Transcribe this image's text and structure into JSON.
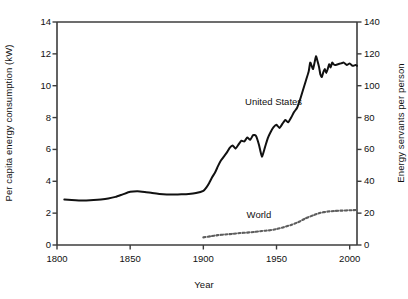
{
  "chart_data": {
    "type": "line",
    "title": "",
    "xlabel": "Year",
    "ylabel": "Per capita energy consumption (kW)",
    "y2label": "Energy servants per person",
    "xlim": [
      1800,
      2005
    ],
    "ylim": [
      0,
      14
    ],
    "y2lim": [
      0,
      140
    ],
    "grid": false,
    "legend": "inline-annotations",
    "xticks": [
      1800,
      1850,
      1900,
      1950,
      2000
    ],
    "xtick_labels": [
      "1800",
      "1850",
      "1900",
      "1950",
      "2000"
    ],
    "yticks": [
      0,
      2,
      4,
      6,
      8,
      10,
      12,
      14
    ],
    "ytick_labels": [
      "0",
      "2",
      "4",
      "6",
      "8",
      "10",
      "12",
      "14"
    ],
    "y2ticks": [
      0,
      20,
      40,
      60,
      80,
      100,
      120,
      140
    ],
    "y2tick_labels": [
      "0",
      "20",
      "40",
      "60",
      "80",
      "100",
      "120",
      "140"
    ],
    "annotations": [
      {
        "text": "United States",
        "x": 1948,
        "y": 8.9
      },
      {
        "text": "World",
        "x": 1938,
        "y": 1.85
      }
    ],
    "series": [
      {
        "name": "United States",
        "style": "solid",
        "color": "#111111",
        "x": [
          1805,
          1810,
          1815,
          1820,
          1825,
          1830,
          1835,
          1840,
          1845,
          1850,
          1855,
          1860,
          1865,
          1870,
          1875,
          1880,
          1885,
          1890,
          1895,
          1900,
          1902,
          1904,
          1906,
          1908,
          1910,
          1912,
          1914,
          1916,
          1918,
          1920,
          1922,
          1924,
          1926,
          1928,
          1930,
          1932,
          1934,
          1936,
          1938,
          1940,
          1942,
          1944,
          1946,
          1948,
          1950,
          1952,
          1954,
          1956,
          1958,
          1960,
          1962,
          1964,
          1966,
          1968,
          1970,
          1972,
          1973,
          1974,
          1975,
          1976,
          1977,
          1978,
          1979,
          1980,
          1981,
          1982,
          1983,
          1984,
          1985,
          1986,
          1987,
          1988,
          1989,
          1990,
          1992,
          1994,
          1996,
          1998,
          2000,
          2002,
          2004,
          2005
        ],
        "y": [
          2.85,
          2.82,
          2.8,
          2.8,
          2.82,
          2.86,
          2.92,
          3.02,
          3.18,
          3.34,
          3.38,
          3.33,
          3.26,
          3.2,
          3.17,
          3.17,
          3.18,
          3.2,
          3.26,
          3.4,
          3.6,
          3.9,
          4.25,
          4.55,
          4.95,
          5.3,
          5.55,
          5.8,
          6.1,
          6.25,
          6.05,
          6.3,
          6.55,
          6.5,
          6.75,
          6.6,
          6.9,
          6.85,
          6.3,
          5.55,
          6.1,
          6.7,
          7.1,
          7.4,
          7.55,
          7.35,
          7.6,
          7.85,
          7.7,
          8.0,
          8.35,
          8.6,
          9.1,
          9.7,
          10.3,
          10.9,
          11.45,
          11.25,
          11.05,
          11.45,
          11.85,
          11.55,
          11.2,
          10.7,
          10.55,
          10.85,
          11.05,
          10.8,
          11.05,
          11.35,
          11.15,
          11.45,
          11.35,
          11.3,
          11.35,
          11.4,
          11.45,
          11.3,
          11.4,
          11.25,
          11.3,
          11.25
        ]
      },
      {
        "name": "World",
        "style": "dotted",
        "color": "#5d5d5d",
        "x": [
          1900,
          1905,
          1910,
          1915,
          1920,
          1925,
          1930,
          1935,
          1940,
          1945,
          1950,
          1955,
          1960,
          1965,
          1970,
          1975,
          1980,
          1985,
          1990,
          1995,
          2000,
          2005
        ],
        "y": [
          0.48,
          0.55,
          0.62,
          0.66,
          0.7,
          0.75,
          0.78,
          0.82,
          0.88,
          0.92,
          1.0,
          1.12,
          1.26,
          1.44,
          1.68,
          1.86,
          2.02,
          2.1,
          2.14,
          2.16,
          2.18,
          2.2
        ]
      }
    ]
  },
  "plot_frame": {
    "left_px": 57,
    "right_px": 357,
    "top_px": 22,
    "bottom_px": 245
  }
}
